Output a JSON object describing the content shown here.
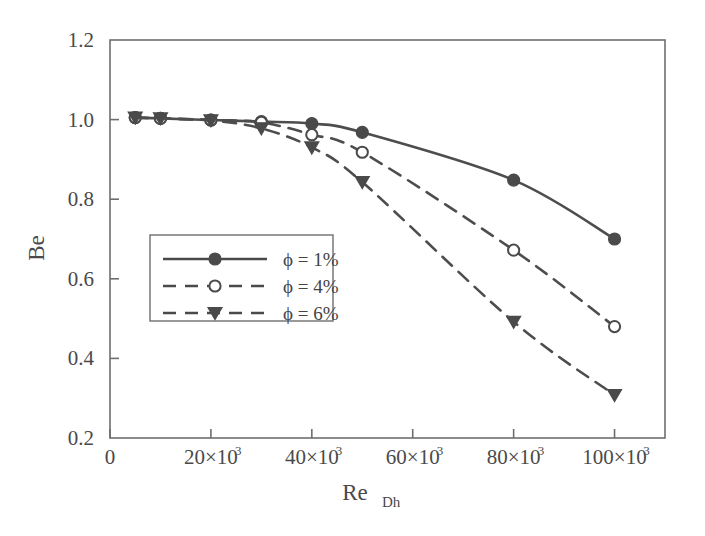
{
  "chart_data": {
    "type": "line",
    "title": "",
    "xlabel": "Re_Dh",
    "xlabel_base": "Re",
    "xlabel_sub": "Dh",
    "ylabel": "Be",
    "xlim": [
      0,
      110000
    ],
    "ylim": [
      0.2,
      1.2
    ],
    "grid": false,
    "legend_position": "center-left",
    "xticks": [
      0,
      20000,
      40000,
      60000,
      80000,
      100000
    ],
    "xtick_labels": [
      "0",
      "20×10³",
      "40×10³",
      "60×10³",
      "80×10³",
      "100×10³"
    ],
    "xtick_mantissas": [
      "0",
      "20×10",
      "40×10",
      "60×10",
      "80×10",
      "100×10"
    ],
    "xtick_exponents": [
      "",
      "3",
      "3",
      "3",
      "3",
      "3"
    ],
    "yticks": [
      0.2,
      0.4,
      0.6,
      0.8,
      1.0,
      1.2
    ],
    "ytick_labels": [
      "0.2",
      "0.4",
      "0.6",
      "0.8",
      "1.0",
      "1.2"
    ],
    "x": [
      5000,
      10000,
      20000,
      30000,
      40000,
      50000,
      80000,
      100000
    ],
    "series": [
      {
        "name": "ϕ = 1%",
        "marker": "filled-circle",
        "linestyle": "solid",
        "color": "#4a4a4a",
        "values": [
          1.005,
          1.003,
          0.999,
          0.995,
          0.99,
          0.968,
          0.848,
          0.7
        ]
      },
      {
        "name": "ϕ = 4%",
        "marker": "open-circle",
        "linestyle": "dashed",
        "color": "#4a4a4a",
        "values": [
          1.005,
          1.003,
          0.999,
          0.993,
          0.962,
          0.918,
          0.672,
          0.48
        ]
      },
      {
        "name": "ϕ = 6%",
        "marker": "filled-triangle-down",
        "linestyle": "dashed",
        "color": "#4a4a4a",
        "values": [
          1.005,
          1.003,
          0.998,
          0.978,
          0.93,
          0.843,
          0.492,
          0.308
        ]
      }
    ]
  },
  "legend": {
    "entries": [
      {
        "label": "ϕ = 1%"
      },
      {
        "label": "ϕ = 4%"
      },
      {
        "label": "ϕ = 6%"
      }
    ]
  }
}
